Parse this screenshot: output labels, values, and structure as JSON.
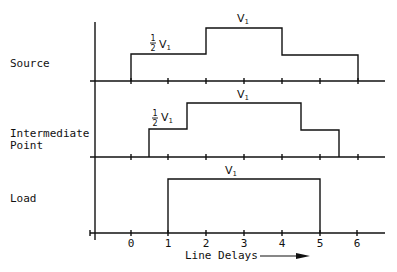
{
  "rows": [
    {
      "name": "source",
      "label_lines": [
        "Source"
      ],
      "waveform": [
        [
          0,
          0
        ],
        [
          0,
          0.5
        ],
        [
          2,
          0.5
        ],
        [
          2,
          1
        ],
        [
          4,
          1
        ],
        [
          4,
          0.5
        ],
        [
          6,
          0.5
        ],
        [
          6,
          0
        ]
      ],
      "annotations": [
        {
          "text": "V",
          "sub": "1",
          "fraction": "1/2",
          "x": 1,
          "level": 0.5
        },
        {
          "text": "V",
          "sub": "1",
          "fraction": "",
          "x": 3,
          "level": 1
        }
      ]
    },
    {
      "name": "intermediate-point",
      "label_lines": [
        "Intermediate",
        "Point"
      ],
      "waveform": [
        [
          0.5,
          0
        ],
        [
          0.5,
          0.5
        ],
        [
          1.5,
          0.5
        ],
        [
          1.5,
          1
        ],
        [
          4.5,
          1
        ],
        [
          4.5,
          0.5
        ],
        [
          5.5,
          0.5
        ],
        [
          5.5,
          0
        ]
      ],
      "annotations": [
        {
          "text": "V",
          "sub": "1",
          "fraction": "1/2",
          "x": 1,
          "level": 0.5
        },
        {
          "text": "V",
          "sub": "1",
          "fraction": "",
          "x": 3,
          "level": 1
        }
      ]
    },
    {
      "name": "load",
      "label_lines": [
        "Load"
      ],
      "waveform": [
        [
          1,
          0
        ],
        [
          1,
          1
        ],
        [
          5,
          1
        ],
        [
          5,
          0
        ]
      ],
      "annotations": [
        {
          "text": "V",
          "sub": "1",
          "fraction": "",
          "x": 3,
          "level": 1
        }
      ]
    }
  ],
  "x_axis": {
    "ticks": [
      "0",
      "1",
      "2",
      "3",
      "4",
      "5",
      "6"
    ],
    "label": "Line Delays",
    "arrow": "right-arrow"
  },
  "fraction_numerator": "1",
  "fraction_denominator": "2",
  "row_labels": {
    "source": "Source",
    "intermediate_1": "Intermediate",
    "intermediate_2": "Point",
    "load": "Load"
  },
  "level_labels": {
    "full": "V",
    "sub": "1"
  }
}
